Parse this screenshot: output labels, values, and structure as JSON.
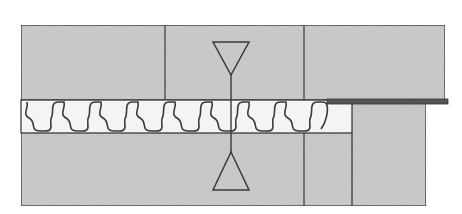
{
  "diagram": {
    "title": "",
    "type": "cross-section schematic",
    "colors": {
      "background": "#ffffff",
      "block_fill": "#c9c9c9",
      "stroke": "#3a3a3a",
      "wave_fill": "#f4f4f4",
      "plate": "#555555"
    },
    "elements": {
      "top_block": {
        "label": "",
        "x": 21,
        "y": 25,
        "w": 424,
        "h": 75,
        "dividers_x": [
          165,
          304
        ]
      },
      "plate": {
        "label": "",
        "x": 327,
        "y": 99,
        "w": 121,
        "h": 5
      },
      "wave_layer": {
        "label": "",
        "x": 21,
        "y": 100,
        "w": 331,
        "h": 33,
        "period": 37
      },
      "bottom_block": {
        "label": "",
        "x": 21,
        "y": 133,
        "w": 331,
        "h": 73,
        "dividers_x": [
          304
        ]
      },
      "right_lower_block": {
        "label": "",
        "x": 352,
        "y": 103,
        "w": 74,
        "h": 103
      },
      "top_marker": {
        "shape": "inverted-triangle",
        "cx": 231,
        "top": 42,
        "bottom": 75,
        "half_width": 18
      },
      "bottom_marker": {
        "shape": "triangle",
        "cx": 231,
        "top": 152,
        "bottom": 190,
        "half_width": 18
      },
      "center_line": {
        "x": 231,
        "y1": 75,
        "y2": 152
      }
    }
  }
}
